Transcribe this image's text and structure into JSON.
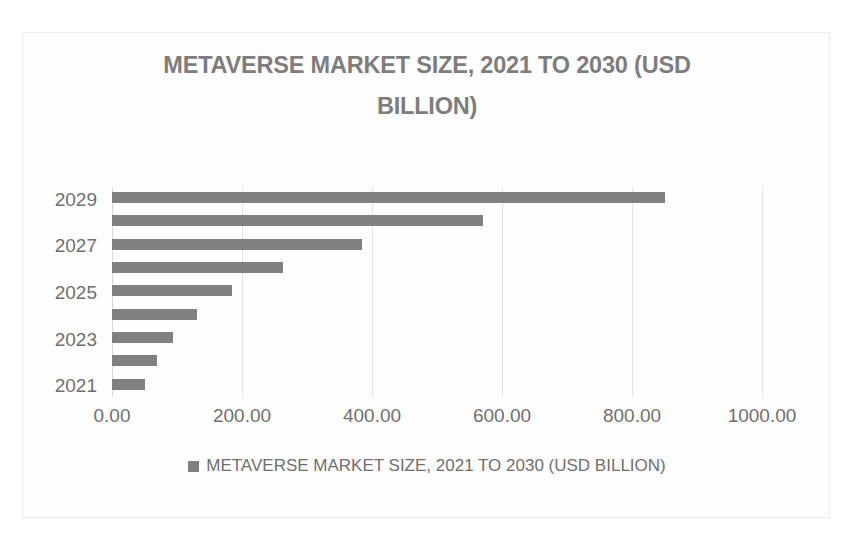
{
  "chart_data": {
    "type": "bar",
    "orientation": "horizontal",
    "title": "METAVERSE MARKET SIZE, 2021 TO 2030 (USD\nBILLION)",
    "title_line1": "METAVERSE MARKET SIZE, 2021 TO 2030 (USD",
    "title_line2": "BILLION)",
    "xlabel": "",
    "ylabel": "",
    "categories": [
      "2021",
      "2022",
      "2023",
      "2024",
      "2025",
      "2026",
      "2027",
      "2028",
      "2029"
    ],
    "values": [
      51,
      69,
      94,
      131,
      185,
      263,
      385,
      570,
      851
    ],
    "series": [
      {
        "name": "METAVERSE MARKET SIZE, 2021 TO 2030 (USD BILLION)",
        "values": [
          51,
          69,
          94,
          131,
          185,
          263,
          385,
          570,
          851
        ],
        "color": "#808080"
      }
    ],
    "xlim": [
      0,
      1000
    ],
    "xticks": [
      0,
      200,
      400,
      600,
      800,
      1000
    ],
    "xtick_labels": [
      "0.00",
      "200.00",
      "400.00",
      "600.00",
      "800.00",
      "1000.00"
    ],
    "ytick_labels": [
      "2021",
      "2023",
      "2025",
      "2027",
      "2029"
    ],
    "grid": "vertical",
    "legend_position": "bottom",
    "legend": [
      {
        "label": "METAVERSE MARKET SIZE, 2021 TO 2030 (USD BILLION)",
        "color": "#808080",
        "marker": "square-swatch"
      }
    ],
    "bar_color": "#808080",
    "text_color": "#6f6f6f",
    "grid_color": "#e2e2e2",
    "background": "#ffffff"
  }
}
